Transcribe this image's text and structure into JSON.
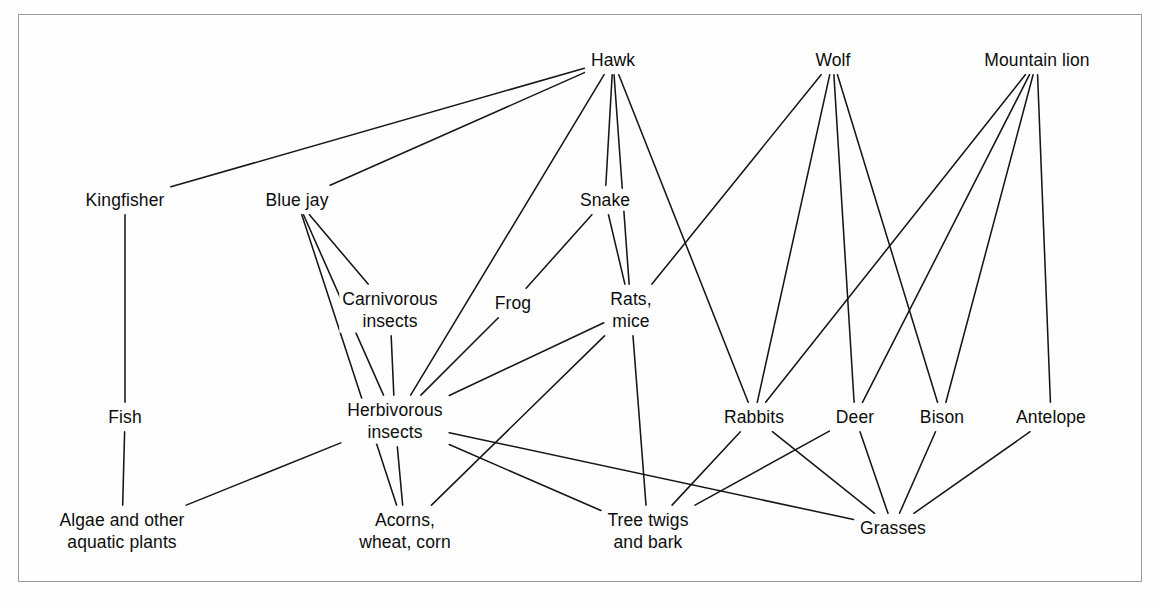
{
  "figure": {
    "kind": "food-web-diagram",
    "background_color": "#fefefe",
    "line_color": "#161616",
    "border_color": "#9a9a9a"
  },
  "chart_data": {
    "type": "diagram",
    "xlabel": "",
    "ylabel": "",
    "grid": false,
    "legend": "none",
    "nodes": [
      {
        "id": "kingfisher",
        "label": "Kingfisher",
        "x": 125,
        "y": 200,
        "trophic": "secondary-consumer"
      },
      {
        "id": "bluejay",
        "label": "Blue jay",
        "x": 297,
        "y": 200,
        "trophic": "secondary-consumer"
      },
      {
        "id": "hawk",
        "label": "Hawk",
        "x": 613,
        "y": 60,
        "trophic": "top-predator"
      },
      {
        "id": "wolf",
        "label": "Wolf",
        "x": 833,
        "y": 60,
        "trophic": "top-predator"
      },
      {
        "id": "mountainlion",
        "label": "Mountain lion",
        "x": 1037,
        "y": 60,
        "trophic": "top-predator"
      },
      {
        "id": "snake",
        "label": "Snake",
        "x": 605,
        "y": 200,
        "trophic": "secondary-consumer"
      },
      {
        "id": "carnins",
        "label": "Carnivorous\ninsects",
        "x": 390,
        "y": 310,
        "trophic": "secondary-consumer"
      },
      {
        "id": "frog",
        "label": "Frog",
        "x": 513,
        "y": 303,
        "trophic": "secondary-consumer"
      },
      {
        "id": "ratsmice",
        "label": "Rats,\nmice",
        "x": 631,
        "y": 310,
        "trophic": "primary-consumer"
      },
      {
        "id": "fish",
        "label": "Fish",
        "x": 125,
        "y": 417,
        "trophic": "primary-consumer"
      },
      {
        "id": "herbins",
        "label": "Herbivorous\ninsects",
        "x": 395,
        "y": 421,
        "trophic": "primary-consumer"
      },
      {
        "id": "rabbits",
        "label": "Rabbits",
        "x": 754,
        "y": 417,
        "trophic": "primary-consumer"
      },
      {
        "id": "deer",
        "label": "Deer",
        "x": 855,
        "y": 417,
        "trophic": "primary-consumer"
      },
      {
        "id": "bison",
        "label": "Bison",
        "x": 942,
        "y": 417,
        "trophic": "primary-consumer"
      },
      {
        "id": "antelope",
        "label": "Antelope",
        "x": 1051,
        "y": 417,
        "trophic": "primary-consumer"
      },
      {
        "id": "algae",
        "label": "Algae and other\naquatic plants",
        "x": 122,
        "y": 531,
        "trophic": "producer"
      },
      {
        "id": "acorns",
        "label": "Acorns,\nwheat, corn",
        "x": 405,
        "y": 531,
        "trophic": "producer"
      },
      {
        "id": "treetwigs",
        "label": "Tree twigs\nand bark",
        "x": 648,
        "y": 531,
        "trophic": "producer"
      },
      {
        "id": "grasses",
        "label": "Grasses",
        "x": 893,
        "y": 528,
        "trophic": "producer"
      }
    ],
    "edges": [
      {
        "from": "hawk",
        "to": "kingfisher"
      },
      {
        "from": "hawk",
        "to": "bluejay"
      },
      {
        "from": "hawk",
        "to": "herbins"
      },
      {
        "from": "hawk",
        "to": "snake"
      },
      {
        "from": "hawk",
        "to": "ratsmice"
      },
      {
        "from": "hawk",
        "to": "rabbits"
      },
      {
        "from": "kingfisher",
        "to": "fish"
      },
      {
        "from": "fish",
        "to": "algae"
      },
      {
        "from": "bluejay",
        "to": "carnins"
      },
      {
        "from": "bluejay",
        "to": "herbins"
      },
      {
        "from": "bluejay",
        "to": "acorns"
      },
      {
        "from": "carnins",
        "to": "herbins"
      },
      {
        "from": "snake",
        "to": "frog"
      },
      {
        "from": "snake",
        "to": "ratsmice"
      },
      {
        "from": "frog",
        "to": "herbins"
      },
      {
        "from": "herbins",
        "to": "algae"
      },
      {
        "from": "herbins",
        "to": "acorns"
      },
      {
        "from": "herbins",
        "to": "grasses"
      },
      {
        "from": "herbins",
        "to": "treetwigs"
      },
      {
        "from": "ratsmice",
        "to": "herbins"
      },
      {
        "from": "ratsmice",
        "to": "acorns"
      },
      {
        "from": "ratsmice",
        "to": "treetwigs"
      },
      {
        "from": "wolf",
        "to": "rabbits"
      },
      {
        "from": "wolf",
        "to": "deer"
      },
      {
        "from": "wolf",
        "to": "bison"
      },
      {
        "from": "wolf",
        "to": "ratsmice"
      },
      {
        "from": "mountainlion",
        "to": "rabbits"
      },
      {
        "from": "mountainlion",
        "to": "deer"
      },
      {
        "from": "mountainlion",
        "to": "bison"
      },
      {
        "from": "mountainlion",
        "to": "antelope"
      },
      {
        "from": "rabbits",
        "to": "treetwigs"
      },
      {
        "from": "rabbits",
        "to": "grasses"
      },
      {
        "from": "deer",
        "to": "treetwigs"
      },
      {
        "from": "deer",
        "to": "grasses"
      },
      {
        "from": "bison",
        "to": "grasses"
      },
      {
        "from": "antelope",
        "to": "grasses"
      }
    ]
  }
}
